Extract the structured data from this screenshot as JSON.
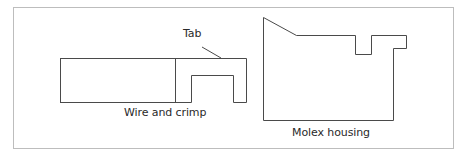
{
  "diagram": {
    "frame": {
      "stroke": "#bdbdbd"
    },
    "line_color": "#4a4a4a",
    "labels": {
      "tab": "Tab",
      "wire_and_crimp": "Wire and crimp",
      "molex_housing": "Molex housing"
    },
    "components": [
      {
        "id": "wire-and-crimp",
        "label": "Wire and crimp",
        "parts": [
          "wire",
          "crimp-terminal",
          "tab"
        ]
      },
      {
        "id": "molex-housing",
        "label": "Molex housing"
      }
    ]
  }
}
